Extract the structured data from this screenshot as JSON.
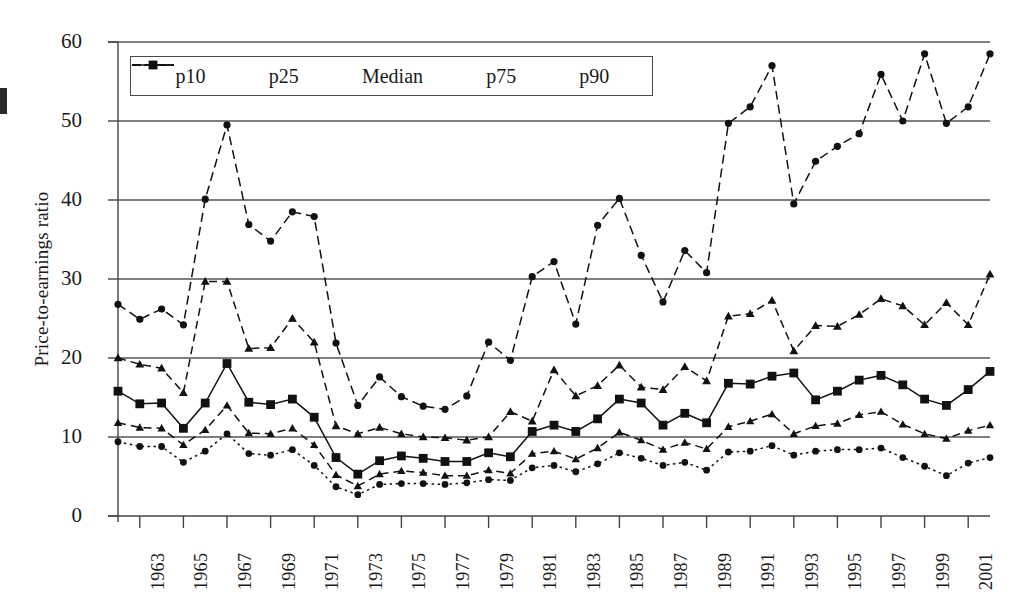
{
  "axes": {
    "ylabel": "Price-to-earnings ratio",
    "yticks": [
      0,
      10,
      20,
      30,
      40,
      50,
      60
    ],
    "ylim": [
      0,
      60
    ],
    "xticks": [
      "1963",
      "1965",
      "1967",
      "1969",
      "1971",
      "1973",
      "1975",
      "1977",
      "1979",
      "1981",
      "1983",
      "1985",
      "1987",
      "1989",
      "1991",
      "1993",
      "1995",
      "1997",
      "1999",
      "2001"
    ],
    "xlim": [
      1962,
      2002
    ]
  },
  "legend": {
    "items": [
      {
        "label": "p10",
        "marker": "circle",
        "dash": "dashdot"
      },
      {
        "label": "p25",
        "marker": "triangle",
        "dash": "dashdot"
      },
      {
        "label": "Median",
        "marker": "square",
        "dash": "solid"
      },
      {
        "label": "p75",
        "marker": "triangle",
        "dash": "dashed"
      },
      {
        "label": "p90",
        "marker": "circle",
        "dash": "dotted"
      }
    ]
  },
  "chart_data": {
    "type": "line",
    "title": "",
    "xlabel": "",
    "ylabel": "Price-to-earnings ratio",
    "ylim": [
      0,
      60
    ],
    "xlim": [
      1962,
      2002
    ],
    "grid": true,
    "legend_position": "top-left",
    "x": [
      1962,
      1963,
      1964,
      1965,
      1966,
      1967,
      1968,
      1969,
      1970,
      1971,
      1972,
      1973,
      1974,
      1975,
      1976,
      1977,
      1978,
      1979,
      1980,
      1981,
      1982,
      1983,
      1984,
      1985,
      1986,
      1987,
      1988,
      1989,
      1990,
      1991,
      1992,
      1993,
      1994,
      1995,
      1996,
      1997,
      1998,
      1999,
      2000,
      2001,
      2002
    ],
    "series": [
      {
        "name": "p90",
        "values": [
          26.8,
          24.9,
          26.2,
          24.2,
          40.1,
          49.5,
          36.9,
          34.8,
          38.5,
          37.9,
          21.9,
          14.0,
          17.6,
          15.1,
          13.9,
          13.5,
          15.2,
          22.0,
          19.7,
          30.3,
          32.2,
          24.3,
          36.8,
          40.2,
          33.0,
          27.1,
          33.6,
          30.8,
          49.7,
          51.8,
          57.0,
          39.5,
          44.9,
          46.8,
          48.4,
          55.9,
          50.0,
          58.5,
          49.7,
          51.8,
          58.5
        ]
      },
      {
        "name": "p75",
        "values": [
          20.0,
          19.2,
          18.7,
          15.6,
          29.7,
          29.7,
          21.2,
          21.3,
          25.0,
          22.0,
          11.4,
          10.4,
          11.2,
          10.4,
          10.0,
          9.9,
          9.6,
          10.0,
          13.2,
          12.0,
          18.5,
          15.2,
          16.5,
          19.1,
          16.3,
          16.0,
          18.9,
          17.1,
          25.3,
          25.6,
          27.3,
          20.9,
          24.1,
          24.0,
          25.5,
          27.5,
          26.6,
          24.2,
          27.0,
          24.2,
          30.6
        ]
      },
      {
        "name": "Median",
        "values": [
          15.8,
          14.2,
          14.3,
          11.1,
          14.3,
          19.3,
          14.4,
          14.1,
          14.8,
          12.5,
          7.4,
          5.3,
          7.0,
          7.6,
          7.3,
          6.9,
          6.9,
          8.0,
          7.5,
          10.7,
          11.5,
          10.7,
          12.3,
          14.8,
          14.3,
          11.5,
          13.0,
          11.8,
          16.8,
          16.7,
          17.7,
          18.1,
          14.7,
          15.8,
          17.2,
          17.8,
          16.6,
          14.8,
          14.0,
          16.0,
          18.3
        ]
      },
      {
        "name": "p25",
        "values": [
          11.8,
          11.2,
          11.1,
          9.0,
          10.9,
          14.0,
          10.5,
          10.4,
          11.1,
          9.0,
          5.2,
          3.8,
          5.3,
          5.7,
          5.5,
          5.1,
          5.1,
          5.8,
          5.4,
          7.9,
          8.2,
          7.2,
          8.6,
          10.6,
          9.6,
          8.4,
          9.3,
          8.5,
          11.3,
          12.0,
          12.9,
          10.4,
          11.4,
          11.7,
          12.8,
          13.2,
          11.6,
          10.4,
          9.8,
          10.8,
          11.5
        ]
      },
      {
        "name": "p10",
        "values": [
          9.4,
          8.8,
          8.8,
          6.8,
          8.2,
          10.4,
          7.9,
          7.7,
          8.4,
          6.4,
          3.7,
          2.7,
          4.0,
          4.1,
          4.1,
          4.0,
          4.2,
          4.6,
          4.5,
          6.1,
          6.4,
          5.6,
          6.6,
          8.0,
          7.3,
          6.4,
          6.8,
          5.8,
          8.1,
          8.2,
          8.9,
          7.7,
          8.2,
          8.4,
          8.4,
          8.6,
          7.4,
          6.3,
          5.1,
          6.7,
          7.4
        ]
      }
    ]
  }
}
